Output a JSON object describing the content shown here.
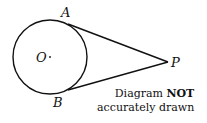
{
  "diagram": {
    "points": {
      "A": "A",
      "B": "B",
      "O": "O",
      "P": "P"
    },
    "note": {
      "prefix": "Diagram ",
      "emphasis": "NOT",
      "line2": "accurately drawn"
    },
    "geometry": {
      "circle": {
        "cx": 50,
        "cy": 57,
        "r": 37
      },
      "A": [
        68,
        24
      ],
      "B": [
        68,
        90
      ],
      "P": [
        168,
        62
      ]
    },
    "stroke_color": "#111111"
  }
}
